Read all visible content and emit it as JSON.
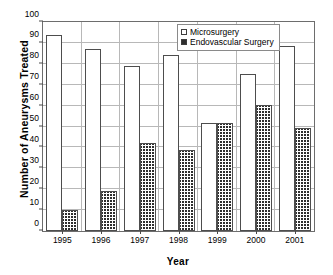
{
  "chart_data": {
    "type": "bar",
    "title": "",
    "xlabel": "Year",
    "ylabel": "Number of Aneurysms Treated",
    "categories": [
      "1995",
      "1996",
      "1997",
      "1998",
      "1999",
      "2000",
      "2001"
    ],
    "series": [
      {
        "name": "Microsurgery",
        "values": [
          94,
          87,
          79,
          84,
          51.5,
          75,
          88.5
        ]
      },
      {
        "name": "Endovascular Surgery",
        "values": [
          10,
          19,
          42,
          39,
          51.5,
          60.5,
          49.5
        ]
      }
    ],
    "ylim": [
      0,
      100
    ],
    "yticks": [
      0,
      10,
      20,
      30,
      40,
      50,
      60,
      70,
      80,
      90,
      100
    ],
    "ytick_labels": [
      "0",
      "10",
      "20",
      "30",
      "40",
      "50",
      "60",
      "70",
      "80",
      "90",
      "100"
    ],
    "grid": true,
    "legend_position": "top-right",
    "legend": [
      {
        "label": "Microsurgery",
        "swatch": "open-square"
      },
      {
        "label": "Endovascular Surgery",
        "swatch": "hatched-square"
      }
    ],
    "colors": {
      "microsurgery_fill": "#ffffff",
      "endovascular_hatch": "#2e2e2e",
      "bar_outline": "#4d4d4d",
      "gridline": "#b8b8b8",
      "axis": "#6d6d6d",
      "text": "#000000",
      "background": "#ffffff"
    }
  }
}
